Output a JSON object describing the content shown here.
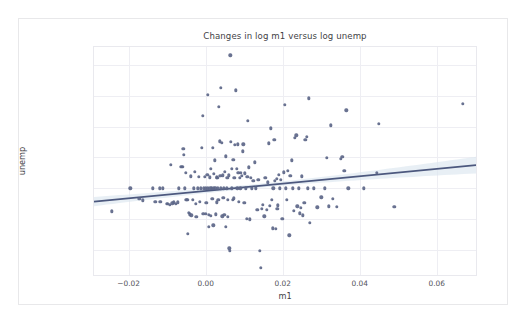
{
  "figure": {
    "background": "#ffffff",
    "card_border": "#e8e8ea"
  },
  "chart_data": {
    "type": "scatter",
    "title": "Changes in log m1 versus log unemp",
    "xlabel": "m1",
    "ylabel": "unemp",
    "xlim": [
      -0.029,
      0.0702
    ],
    "ylim": [
      -0.1405,
      0.2288
    ],
    "xticks": [
      -0.02,
      0.0,
      0.02,
      0.04,
      0.06
    ],
    "xtick_labels": [
      "−0.02",
      "0.00",
      "0.02",
      "0.04",
      "0.06"
    ],
    "yticks": [
      -0.1,
      -0.05,
      0.0,
      0.05,
      0.1,
      0.15,
      0.2
    ],
    "ytick_labels": [
      "−0.10",
      "−0.05",
      "0.00",
      "0.05",
      "0.10",
      "0.15",
      "0.20"
    ],
    "grid": true,
    "legend": null,
    "marker_color": "#5c6688",
    "line_color": "#4c587e",
    "band_color": "#dce7f0",
    "regression": {
      "x_start": -0.029,
      "y_start": -0.0215,
      "x_end": 0.0702,
      "y_end": 0.0375,
      "band_halfwidth_start": 0.0075,
      "band_halfwidth_min": 0.0032,
      "band_halfwidth_end": 0.0135
    },
    "points": [
      [
        -0.0243,
        -0.0374
      ],
      [
        -0.0196,
        -0.0002
      ],
      [
        -0.0172,
        -0.0176
      ],
      [
        -0.0163,
        -0.0196
      ],
      [
        -0.0138,
        -0.0003
      ],
      [
        -0.0131,
        -0.0222
      ],
      [
        -0.012,
        -0.0001
      ],
      [
        -0.0118,
        -0.0215
      ],
      [
        -0.0112,
        -0.0003
      ],
      [
        -0.0101,
        -0.0252
      ],
      [
        -0.0098,
        -0.0253
      ],
      [
        -0.0094,
        -0.0268
      ],
      [
        -0.0091,
        0.0378
      ],
      [
        -0.0087,
        -0.0244
      ],
      [
        -0.0083,
        -0.0229
      ],
      [
        -0.0078,
        -0.0255
      ],
      [
        -0.0073,
        -0.0226
      ],
      [
        -0.007,
        -0.0002
      ],
      [
        -0.0064,
        0.0343
      ],
      [
        -0.0062,
        0.0352
      ],
      [
        -0.006,
        0.0348
      ],
      [
        -0.0058,
        0.064
      ],
      [
        -0.0056,
        0.054
      ],
      [
        -0.0054,
        -0.0001
      ],
      [
        -0.0052,
        0.0248
      ],
      [
        -0.005,
        -0.0184
      ],
      [
        -0.0048,
        -0.0185
      ],
      [
        -0.0046,
        -0.0738
      ],
      [
        -0.0044,
        -0.0396
      ],
      [
        -0.0041,
        -0.0424
      ],
      [
        -0.0039,
        0.0196
      ],
      [
        -0.0037,
        -0.0438
      ],
      [
        -0.0034,
        -0.019
      ],
      [
        -0.0031,
        -0.0002
      ],
      [
        -0.0028,
        0.027
      ],
      [
        -0.0026,
        -0.0253
      ],
      [
        -0.0024,
        -0.0463
      ],
      [
        -0.0021,
        -0.0002
      ],
      [
        -0.0018,
        0.0183
      ],
      [
        -0.0015,
        -0.0216
      ],
      [
        -0.0012,
        -0.0001
      ],
      [
        -0.001,
        0.0651
      ],
      [
        -0.0008,
        0.1168
      ],
      [
        -0.0006,
        -0.0415
      ],
      [
        -0.0004,
        -0.0001
      ],
      [
        -0.0002,
        0.0188
      ],
      [
        0.0,
        -0.0002
      ],
      [
        0.0001,
        -0.0412
      ],
      [
        0.0002,
        -0.0232
      ],
      [
        0.0004,
        0.0222
      ],
      [
        0.0005,
        0.1519
      ],
      [
        0.0006,
        -0.0001
      ],
      [
        0.0008,
        -0.0435
      ],
      [
        0.0009,
        -0.0625
      ],
      [
        0.001,
        0.0176
      ],
      [
        0.0012,
        -0.0001
      ],
      [
        0.0013,
        -0.0443
      ],
      [
        0.0014,
        0.0312
      ],
      [
        0.0016,
        -0.0002
      ],
      [
        0.0017,
        -0.0172
      ],
      [
        0.0018,
        0.0652
      ],
      [
        0.002,
        -0.0601
      ],
      [
        0.0021,
        -0.0001
      ],
      [
        0.0022,
        0.023
      ],
      [
        0.0024,
        0.0455
      ],
      [
        0.0025,
        -0.0003
      ],
      [
        0.0026,
        -0.0421
      ],
      [
        0.0028,
        0.0177
      ],
      [
        0.0029,
        -0.0228
      ],
      [
        0.003,
        0.017
      ],
      [
        0.0032,
        -0.0002
      ],
      [
        0.0033,
        -0.019
      ],
      [
        0.0034,
        0.1325
      ],
      [
        0.0036,
        0.076
      ],
      [
        0.0038,
        0.0204
      ],
      [
        0.0039,
        0.1632
      ],
      [
        0.004,
        -0.0001
      ],
      [
        0.0042,
        0.074
      ],
      [
        0.0043,
        -0.0455
      ],
      [
        0.0044,
        0.021
      ],
      [
        0.0046,
        -0.015
      ],
      [
        0.0047,
        -0.0002
      ],
      [
        0.0048,
        -0.0432
      ],
      [
        0.005,
        0.0263
      ],
      [
        0.0052,
        0.0518
      ],
      [
        0.0053,
        -0.062
      ],
      [
        0.0054,
        -0.0001
      ],
      [
        0.0056,
        0.0166
      ],
      [
        0.0057,
        -0.046
      ],
      [
        0.0058,
        -0.0187
      ],
      [
        0.006,
        0.0208
      ],
      [
        0.0061,
        -0.0973
      ],
      [
        0.0062,
        -0.1018
      ],
      [
        0.0064,
        0.2152
      ],
      [
        0.0066,
        0.0752
      ],
      [
        0.0067,
        -0.0002
      ],
      [
        0.0068,
        0.031
      ],
      [
        0.007,
        -0.019
      ],
      [
        0.0072,
        0.0461
      ],
      [
        0.0073,
        -0.0161
      ],
      [
        0.0074,
        0.0174
      ],
      [
        0.0076,
        0.0708
      ],
      [
        0.0078,
        0.1588
      ],
      [
        0.008,
        0.0316
      ],
      [
        0.0082,
        -0.0002
      ],
      [
        0.0084,
        0.071
      ],
      [
        0.0085,
        0.0255
      ],
      [
        0.0086,
        -0.0214
      ],
      [
        0.0088,
        0.0168
      ],
      [
        0.009,
        -0.0001
      ],
      [
        0.0092,
        0.0248
      ],
      [
        0.0094,
        0.02
      ],
      [
        0.0096,
        0.06
      ],
      [
        0.0098,
        0.0714
      ],
      [
        0.01,
        -0.023
      ],
      [
        0.0102,
        0.024
      ],
      [
        0.0104,
        -0.0002
      ],
      [
        0.0106,
        -0.049
      ],
      [
        0.0108,
        0.0182
      ],
      [
        0.011,
        0.1088
      ],
      [
        0.0112,
        0.0338
      ],
      [
        0.0115,
        -0.0505
      ],
      [
        0.0118,
        0.0172
      ],
      [
        0.012,
        -0.0001
      ],
      [
        0.0124,
        0.0124
      ],
      [
        0.0128,
        0.042
      ],
      [
        0.0131,
        -0.0002
      ],
      [
        0.0134,
        -0.0345
      ],
      [
        0.0137,
        0.014
      ],
      [
        0.014,
        -0.1012
      ],
      [
        0.0143,
        -0.1285
      ],
      [
        0.0146,
        -0.0338
      ],
      [
        0.0149,
        -0.0272
      ],
      [
        0.0152,
        -0.0455
      ],
      [
        0.0155,
        0.0175
      ],
      [
        0.0158,
        -0.0352
      ],
      [
        0.0161,
        0.0098
      ],
      [
        0.0164,
        0.073
      ],
      [
        0.0167,
        -0.0284
      ],
      [
        0.017,
        0.097
      ],
      [
        0.0172,
        -0.0185
      ],
      [
        0.0174,
        -0.065
      ],
      [
        0.0176,
        -0.0002
      ],
      [
        0.0178,
        0.078
      ],
      [
        0.018,
        0.0122
      ],
      [
        0.0182,
        -0.0655
      ],
      [
        0.0184,
        0.0152
      ],
      [
        0.0186,
        -0.0338
      ],
      [
        0.0188,
        -0.0276
      ],
      [
        0.019,
        0.0214
      ],
      [
        0.0193,
        -0.0001
      ],
      [
        0.0196,
        0.0132
      ],
      [
        0.0199,
        -0.05
      ],
      [
        0.0202,
        0.0258
      ],
      [
        0.0205,
        0.1348
      ],
      [
        0.0208,
        -0.0002
      ],
      [
        0.0211,
        -0.0188
      ],
      [
        0.0214,
        0.0288
      ],
      [
        0.0217,
        -0.076
      ],
      [
        0.022,
        0.0204
      ],
      [
        0.0223,
        0.0455
      ],
      [
        0.0226,
        -0.0001
      ],
      [
        0.0229,
        -0.0362
      ],
      [
        0.0232,
        0.0812
      ],
      [
        0.0235,
        0.0858
      ],
      [
        0.0238,
        -0.029
      ],
      [
        0.0241,
        -0.0002
      ],
      [
        0.0244,
        -0.0408
      ],
      [
        0.0247,
        -0.032
      ],
      [
        0.025,
        0.0192
      ],
      [
        0.0253,
        -0.044
      ],
      [
        0.0256,
        -0.0235
      ],
      [
        0.0259,
        0.079
      ],
      [
        0.0262,
        0.083
      ],
      [
        0.0265,
        -0.0001
      ],
      [
        0.0268,
        0.1455
      ],
      [
        0.0271,
        -0.056
      ],
      [
        0.028,
        -0.0002
      ],
      [
        0.029,
        -0.031
      ],
      [
        0.03,
        -0.0148
      ],
      [
        0.031,
        -0.0001
      ],
      [
        0.0315,
        0.0488
      ],
      [
        0.032,
        -0.029
      ],
      [
        0.0325,
        0.1018
      ],
      [
        0.033,
        -0.017
      ],
      [
        0.034,
        -0.0295
      ],
      [
        0.035,
        0.048
      ],
      [
        0.0355,
        0.0515
      ],
      [
        0.036,
        0.028
      ],
      [
        0.0365,
        0.1262
      ],
      [
        0.037,
        -0.0002
      ],
      [
        0.041,
        -0.0001
      ],
      [
        0.0445,
        0.0255
      ],
      [
        0.045,
        0.1042
      ],
      [
        0.049,
        -0.0305
      ],
      [
        0.0667,
        0.1372
      ]
    ]
  }
}
